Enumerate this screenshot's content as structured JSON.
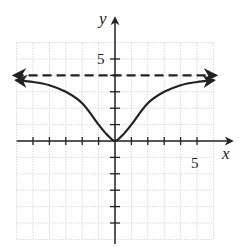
{
  "chart_data": {
    "type": "line",
    "title": "",
    "xlabel": "x",
    "ylabel": "y",
    "xlim": [
      -6,
      6
    ],
    "ylim": [
      -6,
      6
    ],
    "grid": true,
    "tick_labels": {
      "x": [
        "5"
      ],
      "y": [
        "5"
      ]
    },
    "series": [
      {
        "name": "f(x)",
        "style": "solid",
        "x": [
          -6,
          -5,
          -4,
          -3,
          -2,
          -1,
          -0.5,
          0,
          0.5,
          1,
          2,
          3,
          4,
          5,
          6
        ],
        "y": [
          3.7,
          3.6,
          3.4,
          3.0,
          2.3,
          1.0,
          0.4,
          0,
          0.4,
          1.0,
          2.3,
          3.0,
          3.4,
          3.6,
          3.7
        ],
        "arrows": "both-ends"
      },
      {
        "name": "horizontal asymptote",
        "style": "dashed",
        "equation": "y = 4",
        "x": [
          -6,
          6
        ],
        "y": [
          4,
          4
        ],
        "arrows": "both-ends"
      }
    ]
  },
  "labels": {
    "x_axis": "x",
    "y_axis": "y",
    "x_tick": "5",
    "y_tick": "5"
  }
}
